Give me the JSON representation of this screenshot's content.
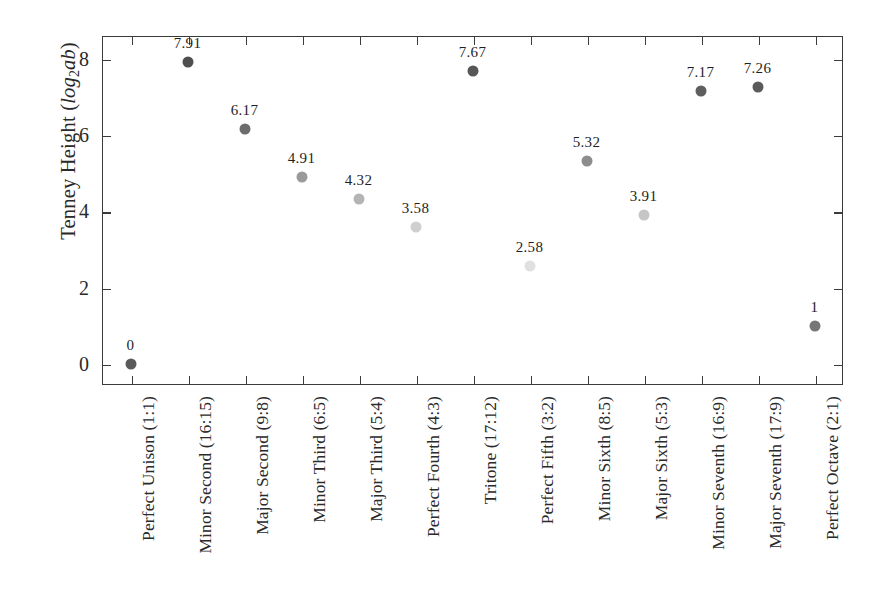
{
  "chart_data": {
    "type": "scatter",
    "title": "",
    "xlabel": "",
    "ylabel": "Tenney Height (log2ab)",
    "ylabel_parts": {
      "prefix": "Tenney Height (",
      "math": "log",
      "sub": "2",
      "math_tail": "ab",
      "suffix": ")"
    },
    "categories": [
      "Perfect Unison (1:1)",
      "Minor Second (16:15)",
      "Major Second (9:8)",
      "Minor Third (6:5)",
      "Major Third (5:4)",
      "Perfect Fourth (4:3)",
      "Tritone (17:12)",
      "Perfect Fifth (3:2)",
      "Minor Sixth (8:5)",
      "Major Sixth (5:3)",
      "Minor Seventh (16:9)",
      "Major Seventh (17:9)",
      "Perfect Octave (2:1)"
    ],
    "values": [
      0,
      7.91,
      6.17,
      4.91,
      4.32,
      3.58,
      7.67,
      2.58,
      5.32,
      3.91,
      7.17,
      7.26,
      1
    ],
    "point_labels": [
      "0",
      "7.91",
      "6.17",
      "4.91",
      "4.32",
      "3.58",
      "7.67",
      "2.58",
      "5.32",
      "3.91",
      "7.17",
      "7.26",
      "1"
    ],
    "point_colors": [
      "#5a5a5a",
      "#4f4f4f",
      "#6d6d6d",
      "#9a9a9a",
      "#b4b4b4",
      "#cfcfcf",
      "#565656",
      "#e0e0e0",
      "#8d8d8d",
      "#c6c6c6",
      "#5e5e5e",
      "#5b5b5b",
      "#767676"
    ],
    "ylim": [
      -0.55,
      8.6
    ],
    "yticks": [
      0,
      2,
      4,
      6,
      8
    ],
    "ytick_labels": [
      "0",
      "2",
      "4",
      "6",
      "8"
    ],
    "grid": false,
    "legend": null,
    "axis_color": "#3b3b3b",
    "frame": "box"
  }
}
